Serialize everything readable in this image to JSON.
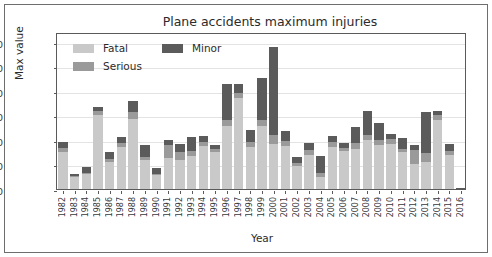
{
  "chart_data": {
    "type": "bar",
    "title": "Plane accidents maximum injuries",
    "xlabel": "Year",
    "ylabel": "Max value",
    "stacked": true,
    "grid": true,
    "legend_position": "upper-left-inside",
    "ylim": [
      0,
      640
    ],
    "yticks": [
      0,
      100,
      200,
      300,
      400,
      500,
      600
    ],
    "ytick_labels": [
      "0",
      "100",
      "200",
      "300",
      "400",
      "500",
      "600"
    ],
    "categories": [
      "1982",
      "1983",
      "1984",
      "1985",
      "1986",
      "1987",
      "1988",
      "1989",
      "1990",
      "1991",
      "1992",
      "1993",
      "1994",
      "1995",
      "1996",
      "1997",
      "1998",
      "1999",
      "2000",
      "2001",
      "2002",
      "2003",
      "2004",
      "2005",
      "2006",
      "2007",
      "2008",
      "2009",
      "2010",
      "2011",
      "2012",
      "2013",
      "2014",
      "2015",
      "2016"
    ],
    "series": [
      {
        "name": "Fatal",
        "color": "#c9c9c9",
        "values": [
          150,
          48,
          60,
          300,
          110,
          170,
          285,
          120,
          58,
          125,
          120,
          135,
          175,
          150,
          255,
          370,
          170,
          255,
          185,
          175,
          95,
          140,
          50,
          170,
          155,
          165,
          200,
          180,
          185,
          150,
          100,
          110,
          280,
          140,
          0
        ]
      },
      {
        "name": "Serious",
        "color": "#9a9a9a",
        "values": [
          18,
          4,
          6,
          20,
          12,
          18,
          28,
          12,
          5,
          55,
          30,
          18,
          18,
          14,
          25,
          22,
          20,
          28,
          35,
          20,
          10,
          18,
          15,
          20,
          12,
          22,
          20,
          20,
          18,
          15,
          60,
          35,
          20,
          15,
          0
        ]
      },
      {
        "name": "Minor",
        "color": "#5b5b5b",
        "values": [
          22,
          8,
          22,
          15,
          30,
          25,
          45,
          48,
          22,
          20,
          35,
          60,
          22,
          16,
          150,
          35,
          50,
          170,
          360,
          40,
          25,
          30,
          70,
          25,
          20,
          65,
          100,
          70,
          20,
          45,
          20,
          170,
          20,
          30,
          5
        ]
      }
    ]
  },
  "legend": {
    "items": [
      {
        "label": "Fatal",
        "color": "#c9c9c9"
      },
      {
        "label": "Minor",
        "color": "#5b5b5b"
      },
      {
        "label": "Serious",
        "color": "#9a9a9a"
      }
    ]
  }
}
